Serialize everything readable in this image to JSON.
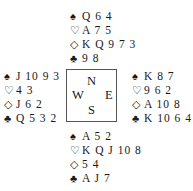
{
  "deal": {
    "north": {
      "spades": {
        "symbol": "♠",
        "cards": "Q 6 4"
      },
      "hearts": {
        "symbol": "♡",
        "cards": "A 7 5"
      },
      "diamonds": {
        "symbol": "◇",
        "cards": "K Q 9 7 3"
      },
      "clubs": {
        "symbol": "♣",
        "cards": "9 8"
      }
    },
    "west": {
      "spades": {
        "symbol": "♠",
        "cards": "J 10 9 3"
      },
      "hearts": {
        "symbol": "♡",
        "cards": "4 3"
      },
      "diamonds": {
        "symbol": "◇",
        "cards": "J 6 2"
      },
      "clubs": {
        "symbol": "♣",
        "cards": "Q 5 3 2"
      }
    },
    "east": {
      "spades": {
        "symbol": "♠",
        "cards": "K 8 7"
      },
      "hearts": {
        "symbol": "♡",
        "cards": "9 6 2"
      },
      "diamonds": {
        "symbol": "◇",
        "cards": "A 10 8"
      },
      "clubs": {
        "symbol": "♣",
        "cards": "K 10 6 4"
      }
    },
    "south": {
      "spades": {
        "symbol": "♠",
        "cards": "A 5 2"
      },
      "hearts": {
        "symbol": "♡",
        "cards": "K Q J 10 8"
      },
      "diamonds": {
        "symbol": "◇",
        "cards": "5 4"
      },
      "clubs": {
        "symbol": "♣",
        "cards": "A J 7"
      }
    }
  },
  "compass": {
    "n": "N",
    "w": "W",
    "e": "E",
    "s": "S"
  }
}
